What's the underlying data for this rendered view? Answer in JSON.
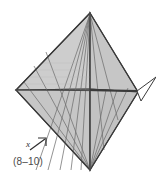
{
  "figure": {
    "kind": "geometric-crease-diagram",
    "caption": "(8–10)",
    "axis": {
      "x_label": "x",
      "arrow_icon": "arrow-up-right-icon"
    },
    "colors": {
      "fill_upper": "#c9c9c9",
      "fill_lower": "#c4c4c4",
      "fill_light": "#d6d6d6",
      "outline": "#3a3a3a",
      "crease_line": "#6b6b6b",
      "axis_line": "#4a4a4a",
      "caption_text": "#4a4a4a",
      "background": "#ffffff"
    },
    "vertices": {
      "apex_top": [
        90,
        13
      ],
      "vertex_left": [
        16,
        90
      ],
      "vertex_right": [
        138,
        92
      ],
      "vertex_bottom": [
        90,
        170
      ],
      "center": [
        90,
        89
      ]
    },
    "flap": {
      "name": "right-flap-triangle",
      "points": "138,92 156,78 140,100"
    },
    "crease_count_upper": 7,
    "crease_count_lower": 6
  }
}
